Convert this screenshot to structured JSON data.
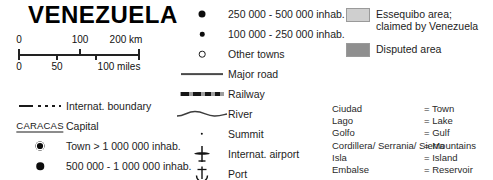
{
  "title": "VENEZUELA",
  "scale": {
    "km": {
      "ticks": [
        {
          "label": "0",
          "pos": 0
        },
        {
          "label": "100",
          "pos": 50
        },
        {
          "label": "200 km",
          "pos": 100
        }
      ]
    },
    "miles": {
      "ticks": [
        {
          "label": "0",
          "pos": 0
        },
        {
          "label": "50",
          "pos": 40
        },
        {
          "label": "100 miles",
          "pos": 80
        }
      ]
    }
  },
  "legend_left": [
    {
      "symbol": "boundary-dash-dot",
      "label": "Internat. boundary"
    },
    {
      "symbol": "capital-underlined-text",
      "label": "Capital",
      "sample": "CARACAS"
    },
    {
      "symbol": "town-ring-dot",
      "label": "Town > 1 000 000 inhab."
    },
    {
      "symbol": "town-large-dot",
      "label": "500 000 - 1 000 000 inhab."
    }
  ],
  "legend_mid": [
    {
      "symbol": "town-dot-xl",
      "label": "250 000 - 500 000 inhab."
    },
    {
      "symbol": "town-dot-md",
      "label": "100 000 - 250 000 inhab."
    },
    {
      "symbol": "town-circle-open",
      "label": "Other towns"
    },
    {
      "symbol": "major-road-line",
      "label": "Major road"
    },
    {
      "symbol": "railway-hatched-line",
      "label": "Railway"
    },
    {
      "symbol": "river-wavy-line",
      "label": "River"
    },
    {
      "symbol": "summit-dot",
      "label": "Summit"
    },
    {
      "symbol": "airplane-icon",
      "label": "Internat. airport"
    },
    {
      "symbol": "anchor-icon",
      "label": "Port"
    }
  ],
  "legend_areas": [
    {
      "symbol": "swatch-light-gray",
      "color": "#cfcfcf",
      "lines": [
        "Essequibo area;",
        "claimed by Venezuela"
      ]
    },
    {
      "symbol": "swatch-dark-gray",
      "color": "#8f8f8f",
      "lines": [
        "Disputed area"
      ]
    }
  ],
  "glossary": [
    {
      "term": "Ciudad",
      "definition": "= Town"
    },
    {
      "term": "Lago",
      "definition": "= Lake"
    },
    {
      "term": "Golfo",
      "definition": "= Gulf"
    },
    {
      "term": "Cordillera/ Serrania/ Sierra",
      "definition": "= Mountains"
    },
    {
      "term": "Isla",
      "definition": "= Island"
    },
    {
      "term": "Embalse",
      "definition": "= Reservoir"
    }
  ]
}
